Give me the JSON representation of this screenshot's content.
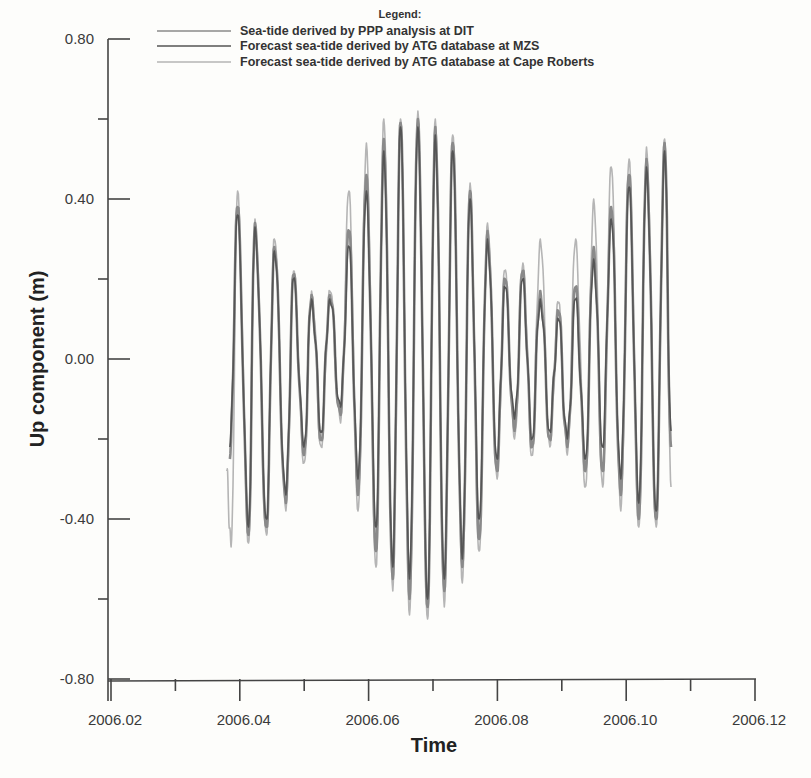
{
  "chart_data": {
    "type": "line",
    "title": "",
    "xlabel": "Time",
    "ylabel": "Up component (m)",
    "xlim": [
      2006.02,
      2006.12
    ],
    "ylim": [
      -0.8,
      0.8
    ],
    "x_ticks": [
      "2006.02",
      "2006.04",
      "2006.06",
      "2006.08",
      "2006.10",
      "2006.12"
    ],
    "x_tick_values": [
      2006.02,
      2006.04,
      2006.06,
      2006.08,
      2006.1,
      2006.12
    ],
    "y_ticks": [
      "0.80",
      "0.40",
      "0.00",
      "-0.40",
      "-0.80"
    ],
    "y_tick_values": [
      0.8,
      0.4,
      0.0,
      -0.4,
      -0.8
    ],
    "grid": false,
    "legend": {
      "title": "Legend:",
      "position": "top-center",
      "entries": [
        {
          "label": "Sea-tide derived by PPP analysis at DIT",
          "color": "#8a8a8a"
        },
        {
          "label": "Forecast sea-tide derived by ATG database at MZS",
          "color": "#555555"
        },
        {
          "label": "Forecast sea-tide derived by ATG database at Cape Roberts",
          "color": "#b5b5b5"
        }
      ]
    },
    "series_extrema_note": "Approximate alternating peak/trough values (m) read from the plot, semi-diurnal/diurnal tidal oscillation",
    "series": [
      {
        "name": "Forecast sea-tide derived by ATG database at MZS",
        "color": "#555555",
        "x": [
          2006.0383,
          2006.0395,
          2006.0412,
          2006.0422,
          2006.044,
          2006.0452,
          2006.047,
          2006.0482,
          2006.0498,
          2006.051,
          2006.0525,
          2006.0538,
          2006.0555,
          2006.0568,
          2006.0582,
          2006.0595,
          2006.061,
          2006.0622,
          2006.0636,
          2006.0648,
          2006.0662,
          2006.0675,
          2006.069,
          2006.0702,
          2006.0716,
          2006.0729,
          2006.0744,
          2006.0756,
          2006.077,
          2006.0783,
          2006.0798,
          2006.081,
          2006.0825,
          2006.0838,
          2006.0852,
          2006.0865,
          2006.088,
          2006.0893,
          2006.0907,
          2006.092,
          2006.0935,
          2006.0948,
          2006.0962,
          2006.0975,
          2006.099,
          2006.1003,
          2006.1018,
          2006.103,
          2006.1045,
          2006.1058,
          2006.1068
        ],
        "values": [
          -0.22,
          0.36,
          -0.42,
          0.33,
          -0.4,
          0.27,
          -0.34,
          0.2,
          -0.22,
          0.15,
          -0.18,
          0.15,
          -0.12,
          0.28,
          -0.3,
          0.42,
          -0.42,
          0.52,
          -0.52,
          0.58,
          -0.55,
          0.58,
          -0.6,
          0.56,
          -0.55,
          0.52,
          -0.5,
          0.4,
          -0.4,
          0.3,
          -0.25,
          0.18,
          -0.15,
          0.2,
          -0.2,
          0.15,
          -0.18,
          0.1,
          -0.2,
          0.15,
          -0.25,
          0.25,
          -0.22,
          0.35,
          -0.3,
          0.43,
          -0.36,
          0.48,
          -0.38,
          0.52,
          -0.18
        ]
      },
      {
        "name": "Sea-tide derived by PPP analysis at DIT",
        "color": "#8a8a8a",
        "x": [
          2006.0383,
          2006.0395,
          2006.0412,
          2006.0422,
          2006.044,
          2006.0452,
          2006.047,
          2006.0482,
          2006.0498,
          2006.051,
          2006.0525,
          2006.0538,
          2006.0555,
          2006.0568,
          2006.0582,
          2006.0595,
          2006.061,
          2006.0622,
          2006.0636,
          2006.0648,
          2006.0662,
          2006.0675,
          2006.069,
          2006.0702,
          2006.0716,
          2006.0729,
          2006.0744,
          2006.0756,
          2006.077,
          2006.0783,
          2006.0798,
          2006.081,
          2006.0825,
          2006.0838,
          2006.0852,
          2006.0865,
          2006.088,
          2006.0893,
          2006.0907,
          2006.092,
          2006.0935,
          2006.0948,
          2006.0962,
          2006.0975,
          2006.099,
          2006.1003,
          2006.1018,
          2006.103,
          2006.1045,
          2006.1058,
          2006.1068
        ],
        "values": [
          -0.25,
          0.38,
          -0.44,
          0.34,
          -0.42,
          0.28,
          -0.36,
          0.21,
          -0.24,
          0.16,
          -0.2,
          0.16,
          -0.14,
          0.32,
          -0.34,
          0.46,
          -0.48,
          0.55,
          -0.55,
          0.59,
          -0.6,
          0.6,
          -0.62,
          0.58,
          -0.58,
          0.54,
          -0.52,
          0.42,
          -0.45,
          0.32,
          -0.28,
          0.2,
          -0.18,
          0.22,
          -0.22,
          0.17,
          -0.2,
          0.12,
          -0.22,
          0.18,
          -0.28,
          0.28,
          -0.28,
          0.38,
          -0.34,
          0.46,
          -0.4,
          0.5,
          -0.4,
          0.54,
          -0.22
        ]
      },
      {
        "name": "Forecast sea-tide derived by ATG database at Cape Roberts",
        "color": "#b5b5b5",
        "x": [
          2006.0378,
          2006.0385,
          2006.0395,
          2006.0412,
          2006.0422,
          2006.044,
          2006.0452,
          2006.047,
          2006.0482,
          2006.0498,
          2006.051,
          2006.0525,
          2006.0538,
          2006.0555,
          2006.0568,
          2006.0582,
          2006.0595,
          2006.061,
          2006.0622,
          2006.0636,
          2006.0648,
          2006.0662,
          2006.0675,
          2006.069,
          2006.0702,
          2006.0716,
          2006.0729,
          2006.0744,
          2006.0756,
          2006.077,
          2006.0783,
          2006.0798,
          2006.081,
          2006.0825,
          2006.0838,
          2006.0852,
          2006.0865,
          2006.088,
          2006.0893,
          2006.0907,
          2006.092,
          2006.0935,
          2006.0948,
          2006.0962,
          2006.0975,
          2006.099,
          2006.1003,
          2006.1018,
          2006.103,
          2006.1045,
          2006.1058,
          2006.1068
        ],
        "values": [
          -0.28,
          -0.47,
          0.42,
          -0.46,
          0.35,
          -0.44,
          0.3,
          -0.38,
          0.22,
          -0.26,
          0.17,
          -0.22,
          0.17,
          -0.16,
          0.42,
          -0.38,
          0.54,
          -0.52,
          0.6,
          -0.58,
          0.6,
          -0.64,
          0.62,
          -0.65,
          0.6,
          -0.62,
          0.56,
          -0.56,
          0.44,
          -0.48,
          0.34,
          -0.3,
          0.22,
          -0.2,
          0.24,
          -0.24,
          0.3,
          -0.22,
          0.14,
          -0.24,
          0.3,
          -0.32,
          0.4,
          -0.32,
          0.48,
          -0.38,
          0.5,
          -0.42,
          0.53,
          -0.42,
          0.55,
          -0.32
        ]
      }
    ]
  },
  "layout": {
    "plot": {
      "x0": 112,
      "x1": 756,
      "y_top": 39,
      "y_bottom": 679
    },
    "legend_title_pos": [
      400,
      38
    ]
  }
}
